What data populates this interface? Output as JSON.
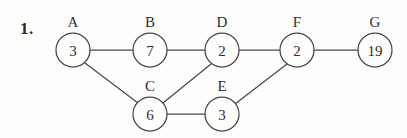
{
  "problem": {
    "number_label": "1."
  },
  "diagram": {
    "type": "undirected-graph",
    "background_color": "#fdfdfc",
    "stroke_color": "#4a4a4a",
    "text_color": "#2f2f2f",
    "node_radius": 17,
    "nodes": [
      {
        "id": "A",
        "label": "A",
        "value": "3",
        "cx": 73,
        "cy": 50,
        "label_x": 73,
        "label_y": 27
      },
      {
        "id": "B",
        "label": "B",
        "value": "7",
        "cx": 150,
        "cy": 50,
        "label_x": 150,
        "label_y": 27
      },
      {
        "id": "D",
        "label": "D",
        "value": "2",
        "cx": 222,
        "cy": 50,
        "label_x": 222,
        "label_y": 27
      },
      {
        "id": "F",
        "label": "F",
        "value": "2",
        "cx": 297,
        "cy": 50,
        "label_x": 297,
        "label_y": 27
      },
      {
        "id": "G",
        "label": "G",
        "value": "19",
        "cx": 375,
        "cy": 50,
        "label_x": 375,
        "label_y": 27
      },
      {
        "id": "C",
        "label": "C",
        "value": "6",
        "cx": 150,
        "cy": 114,
        "label_x": 150,
        "label_y": 91
      },
      {
        "id": "E",
        "label": "E",
        "value": "3",
        "cx": 222,
        "cy": 114,
        "label_x": 222,
        "label_y": 91
      }
    ],
    "edges": [
      {
        "from": "A",
        "to": "B",
        "x1": 90,
        "y1": 50,
        "x2": 133,
        "y2": 50
      },
      {
        "from": "A",
        "to": "C",
        "x1": 85,
        "y1": 63,
        "x2": 138,
        "y2": 103
      },
      {
        "from": "B",
        "to": "D",
        "x1": 167,
        "y1": 50,
        "x2": 205,
        "y2": 50
      },
      {
        "from": "C",
        "to": "D",
        "x1": 163,
        "y1": 103,
        "x2": 211,
        "y2": 64
      },
      {
        "from": "C",
        "to": "E",
        "x1": 167,
        "y1": 114,
        "x2": 205,
        "y2": 114
      },
      {
        "from": "D",
        "to": "F",
        "x1": 239,
        "y1": 50,
        "x2": 280,
        "y2": 50
      },
      {
        "from": "E",
        "to": "F",
        "x1": 235,
        "y1": 104,
        "x2": 287,
        "y2": 64
      },
      {
        "from": "F",
        "to": "G",
        "x1": 314,
        "y1": 50,
        "x2": 358,
        "y2": 50
      }
    ]
  }
}
